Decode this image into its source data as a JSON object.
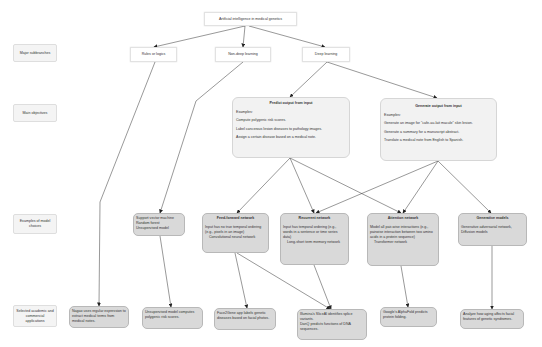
{
  "root": {
    "title": "Artificial intelligence in medical genetics"
  },
  "row_labels": [
    "Major subbranches",
    "Main objectives",
    "Examples of model choices",
    "Selected academic and commercial applications"
  ],
  "subbranches": [
    {
      "label": "Rules or logics"
    },
    {
      "label": "Non-deep learning"
    },
    {
      "label": "Deep learning"
    }
  ],
  "objectives": [
    {
      "title": "Predict output from input",
      "examples_label": "Examples:",
      "examples": [
        "Compute polygenic risk scores.",
        "Label cancerous lesion diseases to pathology images.",
        "Assign a certain disease based on a medical note."
      ]
    },
    {
      "title": "Generate output from input",
      "examples_label": "Examples:",
      "examples": [
        "Generate an image for \"cafe-au-lait macule\" skin lesion.",
        "Generate a summary for a manuscript abstract.",
        "Translate a medical note from English to Spanish."
      ]
    }
  ],
  "models": [
    {
      "title": "",
      "lines": [
        "Support vector machine",
        "Random forest",
        "Unsupervised model"
      ]
    },
    {
      "title": "Feed-forward network",
      "lines": [
        "Input has no true temporal ordering (e.g., pixels in an image)",
        "Convolutional neural network"
      ]
    },
    {
      "title": "Recurrent network",
      "lines": [
        "Input has temporal ordering (e.g., words in a sentence or time series data)",
        "Long-short term memory network"
      ]
    },
    {
      "title": "Attention network",
      "lines": [
        "Model all pair-wise interactions (e.g., pairwise interaction between two amino acids in a protein sequence)",
        "Transformer network"
      ]
    },
    {
      "title": "Generative models",
      "lines": [
        "Generative adversarial network, Diffusion models"
      ]
    }
  ],
  "applications": [
    {
      "text": "Nagao uses regular expression to extract medical terms from medical notes."
    },
    {
      "text": "Unsupervised model computes polygenic risk scores."
    },
    {
      "text": "Face2Gene app labels genetic diseases based on facial photos."
    },
    {
      "lines": [
        "Illumina's SliceAI identifies splice variants.",
        "DanQ predicts functions of DNA sequences."
      ]
    },
    {
      "text": "Google's AlphaFold predicts protein folding."
    },
    {
      "text": "Analyze how aging affects facial features of genetic syndromes."
    }
  ],
  "colors": {
    "edge": "#333333",
    "objective_fill": "#f2f2f2",
    "model_fill": "#d9d9d9",
    "app_fill": "#d9d9d9"
  }
}
